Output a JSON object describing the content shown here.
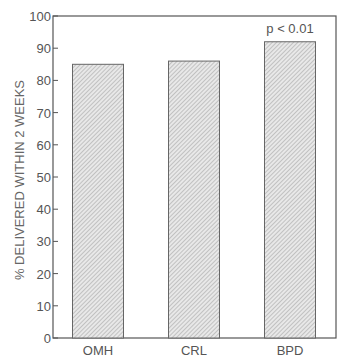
{
  "chart_data": {
    "type": "bar",
    "title": "",
    "xlabel": "",
    "ylabel": "% DELIVERED WITHIN 2 WEEKS",
    "categories": [
      "OMH",
      "CRL",
      "BPD"
    ],
    "values": [
      85,
      86,
      92
    ],
    "ylim": [
      0,
      100
    ],
    "yticks": [
      0,
      10,
      20,
      30,
      40,
      50,
      60,
      70,
      80,
      90,
      100
    ],
    "grid": false,
    "legend": null,
    "annotations": [
      {
        "text": "p < 0.01",
        "category": "BPD",
        "position": "above-bar"
      }
    ],
    "bar_fill": "diagonal-hatch",
    "colors": {
      "bar_fill": "#e6e6e6",
      "hatch": "#9a9a9a",
      "frame": "#555555"
    }
  }
}
